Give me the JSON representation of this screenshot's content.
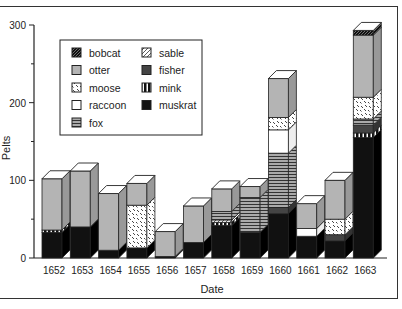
{
  "chart_data": {
    "type": "bar",
    "stacked": true,
    "style": "3d",
    "title": "",
    "xlabel": "Date",
    "ylabel": "Pelts",
    "ylim": [
      0,
      300
    ],
    "yticks": [
      0,
      100,
      200,
      300
    ],
    "grid": false,
    "legend_position": "upper-left-inside",
    "categories": [
      "1652",
      "1653",
      "1654",
      "1655",
      "1656",
      "1657",
      "1658",
      "1659",
      "1660",
      "1661",
      "1662",
      "1663"
    ],
    "series": [
      {
        "name": "muskrat",
        "pattern": "solid-black",
        "values": [
          33,
          40,
          10,
          13,
          2,
          20,
          42,
          33,
          57,
          28,
          22,
          155
        ]
      },
      {
        "name": "mink",
        "pattern": "vertical-bars",
        "values": [
          3,
          0,
          0,
          0,
          0,
          0,
          4,
          0,
          0,
          0,
          0,
          6
        ]
      },
      {
        "name": "fisher",
        "pattern": "dark-gray",
        "values": [
          0,
          0,
          0,
          0,
          0,
          0,
          0,
          0,
          8,
          0,
          8,
          10
        ]
      },
      {
        "name": "sable",
        "pattern": "diagonal-light",
        "values": [
          0,
          0,
          0,
          0,
          0,
          0,
          3,
          0,
          0,
          0,
          0,
          0
        ]
      },
      {
        "name": "fox",
        "pattern": "horizontal-lines",
        "values": [
          0,
          0,
          0,
          0,
          0,
          0,
          11,
          45,
          70,
          0,
          0,
          8
        ]
      },
      {
        "name": "raccoon",
        "pattern": "white",
        "values": [
          0,
          0,
          0,
          0,
          0,
          0,
          0,
          0,
          30,
          10,
          0,
          0
        ]
      },
      {
        "name": "moose",
        "pattern": "speckled",
        "values": [
          0,
          0,
          0,
          55,
          0,
          0,
          0,
          0,
          16,
          0,
          20,
          28
        ]
      },
      {
        "name": "otter",
        "pattern": "light-gray",
        "values": [
          66,
          72,
          73,
          28,
          32,
          47,
          29,
          14,
          50,
          32,
          50,
          80
        ]
      },
      {
        "name": "bobcat",
        "pattern": "diagonal-dark",
        "values": [
          0,
          0,
          0,
          0,
          0,
          0,
          0,
          0,
          0,
          0,
          0,
          6
        ]
      }
    ],
    "legend": [
      [
        "bobcat",
        "sable"
      ],
      [
        "otter",
        "fisher"
      ],
      [
        "moose",
        "mink"
      ],
      [
        "raccoon",
        "muskrat"
      ],
      [
        "fox"
      ]
    ]
  },
  "axis": {
    "y_title": "Pelts",
    "x_title": "Date",
    "y_tick_labels": [
      "0",
      "100",
      "200",
      "300"
    ]
  },
  "legend_labels": {
    "bobcat": "bobcat",
    "otter": "otter",
    "moose": "moose",
    "raccoon": "raccoon",
    "fox": "fox",
    "sable": "sable",
    "fisher": "fisher",
    "mink": "mink",
    "muskrat": "muskrat"
  }
}
